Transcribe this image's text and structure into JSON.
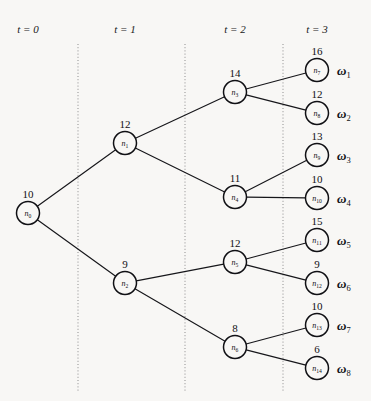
{
  "figure": {
    "background_color": "#f8f7f5",
    "line_color": "#16161a",
    "rule_color": "#8d8d8d",
    "width": 371,
    "height": 401
  },
  "stages": [
    {
      "id": "t0",
      "label": "t = 0",
      "x": 28,
      "rule_x": null
    },
    {
      "id": "t1",
      "label": "t = 1",
      "x": 125,
      "rule_x": 78
    },
    {
      "id": "t2",
      "label": "t = 2",
      "x": 235,
      "rule_x": 185
    },
    {
      "id": "t3",
      "label": "t = 3",
      "x": 317,
      "rule_x": 283
    }
  ],
  "stage_label_y": 33,
  "rule_top": 44,
  "rule_bottom": 392,
  "node_radius": 11.5,
  "nodes": [
    {
      "id": "n0",
      "name": "n",
      "subscript": "0",
      "value": "10",
      "x": 28,
      "y": 213,
      "stage": "t0"
    },
    {
      "id": "n1",
      "name": "n",
      "subscript": "1",
      "value": "12",
      "x": 125,
      "y": 143,
      "stage": "t1"
    },
    {
      "id": "n2",
      "name": "n",
      "subscript": "2",
      "value": "9",
      "x": 125,
      "y": 283,
      "stage": "t1"
    },
    {
      "id": "n3",
      "name": "n",
      "subscript": "3",
      "value": "14",
      "x": 235,
      "y": 92,
      "stage": "t2"
    },
    {
      "id": "n4",
      "name": "n",
      "subscript": "4",
      "value": "11",
      "x": 235,
      "y": 197,
      "stage": "t2"
    },
    {
      "id": "n5",
      "name": "n",
      "subscript": "5",
      "value": "12",
      "x": 235,
      "y": 262,
      "stage": "t2"
    },
    {
      "id": "n6",
      "name": "n",
      "subscript": "6",
      "value": "8",
      "x": 235,
      "y": 347,
      "stage": "t2"
    },
    {
      "id": "n7",
      "name": "n",
      "subscript": "7",
      "value": "16",
      "x": 317,
      "y": 70,
      "stage": "t3"
    },
    {
      "id": "n8",
      "name": "n",
      "subscript": "8",
      "value": "12",
      "x": 317,
      "y": 113,
      "stage": "t3"
    },
    {
      "id": "n9",
      "name": "n",
      "subscript": "9",
      "value": "13",
      "x": 317,
      "y": 155,
      "stage": "t3"
    },
    {
      "id": "n10",
      "name": "n",
      "subscript": "10",
      "value": "10",
      "x": 317,
      "y": 198,
      "stage": "t3"
    },
    {
      "id": "n11",
      "name": "n",
      "subscript": "11",
      "value": "15",
      "x": 317,
      "y": 240,
      "stage": "t3"
    },
    {
      "id": "n12",
      "name": "n",
      "subscript": "12",
      "value": "9",
      "x": 317,
      "y": 283,
      "stage": "t3"
    },
    {
      "id": "n13",
      "name": "n",
      "subscript": "13",
      "value": "10",
      "x": 317,
      "y": 325,
      "stage": "t3"
    },
    {
      "id": "n14",
      "name": "n",
      "subscript": "14",
      "value": "6",
      "x": 317,
      "y": 368,
      "stage": "t3"
    }
  ],
  "edges": [
    {
      "from": "n0",
      "to": "n1"
    },
    {
      "from": "n0",
      "to": "n2"
    },
    {
      "from": "n1",
      "to": "n3"
    },
    {
      "from": "n1",
      "to": "n4"
    },
    {
      "from": "n2",
      "to": "n5"
    },
    {
      "from": "n2",
      "to": "n6"
    },
    {
      "from": "n3",
      "to": "n7"
    },
    {
      "from": "n3",
      "to": "n8"
    },
    {
      "from": "n4",
      "to": "n9"
    },
    {
      "from": "n4",
      "to": "n10"
    },
    {
      "from": "n5",
      "to": "n11"
    },
    {
      "from": "n5",
      "to": "n12"
    },
    {
      "from": "n6",
      "to": "n13"
    },
    {
      "from": "n6",
      "to": "n14"
    }
  ],
  "outcomes": [
    {
      "id": "w1",
      "symbol": "ω",
      "subscript": "1",
      "node": "n7",
      "x": 337
    },
    {
      "id": "w2",
      "symbol": "ω",
      "subscript": "2",
      "node": "n8",
      "x": 337
    },
    {
      "id": "w3",
      "symbol": "ω",
      "subscript": "3",
      "node": "n9",
      "x": 337
    },
    {
      "id": "w4",
      "symbol": "ω",
      "subscript": "4",
      "node": "n10",
      "x": 337
    },
    {
      "id": "w5",
      "symbol": "ω",
      "subscript": "5",
      "node": "n11",
      "x": 337
    },
    {
      "id": "w6",
      "symbol": "ω",
      "subscript": "6",
      "node": "n12",
      "x": 337
    },
    {
      "id": "w7",
      "symbol": "ω",
      "subscript": "7",
      "node": "n13",
      "x": 337
    },
    {
      "id": "w8",
      "symbol": "ω",
      "subscript": "8",
      "node": "n14",
      "x": 337
    }
  ]
}
